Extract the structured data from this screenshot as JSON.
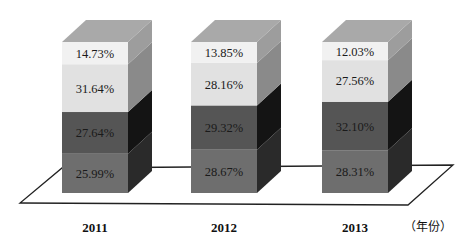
{
  "chart_data": {
    "type": "bar",
    "subtype": "stacked-3d-percent",
    "title": "",
    "xlabel": "（年份）",
    "ylabel": "",
    "categories": [
      "2011",
      "2012",
      "2013"
    ],
    "series": [
      {
        "name": "segment-1 (bottom)",
        "color": "#6e6e6e",
        "values": [
          25.99,
          28.67,
          28.31
        ]
      },
      {
        "name": "segment-2",
        "color": "#555555",
        "values": [
          27.64,
          29.32,
          32.1
        ]
      },
      {
        "name": "segment-3",
        "color": "#e1e1e1",
        "values": [
          31.64,
          28.16,
          27.56
        ]
      },
      {
        "name": "segment-4 (top)",
        "color": "#f1f1f1",
        "values": [
          14.73,
          13.85,
          12.03
        ]
      }
    ],
    "labels": [
      [
        "25.99%",
        "27.64%",
        "31.64%",
        "14.73%"
      ],
      [
        "28.67%",
        "29.32%",
        "28.16%",
        "13.85%"
      ],
      [
        "28.31%",
        "32.10%",
        "27.56%",
        "12.03%"
      ]
    ],
    "ylim": [
      0,
      100
    ],
    "grid": false,
    "legend": "none"
  },
  "axis": {
    "unit_label": "（年份）"
  },
  "colors": {
    "background": "#ffffff",
    "floor_stroke": "#222222",
    "top_face": "#a9a9a9",
    "side_light": "#9a9a9a",
    "side_dark": "#1c1c1c"
  }
}
